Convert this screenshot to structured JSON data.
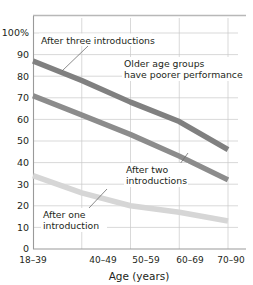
{
  "chart_data": {
    "type": "line",
    "title": "",
    "xlabel": "Age (years)",
    "ylabel": "",
    "categories": [
      "18–39",
      "40–49",
      "50–59",
      "60–69",
      "70–90"
    ],
    "ylim": [
      0,
      100
    ],
    "ytick_labels": [
      "100%",
      "90",
      "80",
      "70",
      "60",
      "50",
      "40",
      "30",
      "20",
      "10",
      "0"
    ],
    "ytick_values": [
      100,
      90,
      80,
      70,
      60,
      50,
      40,
      30,
      20,
      10,
      0
    ],
    "grid": true,
    "legend_position": "none",
    "series": [
      {
        "name": "After three introductions",
        "color": "#808080",
        "values": [
          87,
          78,
          68,
          59,
          46
        ]
      },
      {
        "name": "After two introductions",
        "color": "#8c8c8c",
        "values": [
          71,
          62,
          53,
          43,
          32
        ]
      },
      {
        "name": "After one introduction",
        "color": "#d6d6d6",
        "values": [
          34,
          26,
          20,
          17,
          13
        ]
      }
    ],
    "annotations": [
      {
        "id": "annot-after-three",
        "lines": [
          "After three introductions"
        ],
        "text": "After three introductions"
      },
      {
        "id": "annot-older-age-groups",
        "lines": [
          "Older age groups",
          "have poorer performance"
        ],
        "text": "Older age groups have poorer performance"
      },
      {
        "id": "annot-after-two",
        "lines": [
          "After two",
          "introductions"
        ],
        "text": "After two introductions"
      },
      {
        "id": "annot-after-one",
        "lines": [
          "After one",
          "introduction"
        ],
        "text": "After one introduction"
      }
    ]
  },
  "axis": {
    "y": {
      "t100": "100%",
      "t90": "90",
      "t80": "80",
      "t70": "70",
      "t60": "60",
      "t50": "50",
      "t40": "40",
      "t30": "30",
      "t20": "20",
      "t10": "10",
      "t0": "0"
    },
    "x": {
      "c0": "18–39",
      "c1": "40–49",
      "c2": "50–59",
      "c3": "60–69",
      "c4": "70–90",
      "title": "Age (years)"
    }
  },
  "annotations": {
    "after_three": "After three introductions",
    "older_line1": "Older age groups",
    "older_line2": "have poorer performance",
    "after_two_line1": "After two",
    "after_two_line2": "introductions",
    "after_one_line1": "After one",
    "after_one_line2": "introduction"
  }
}
